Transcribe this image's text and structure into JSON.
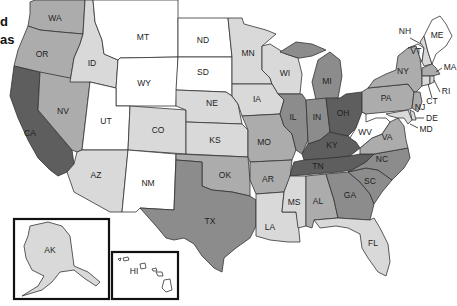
{
  "cutoff_text": {
    "line1": "d",
    "line2": "as"
  },
  "shades": {
    "white": "#ffffff",
    "light": "#d9d9d9",
    "medium_light": "#acacac",
    "medium": "#8c8c8c",
    "dark": "#5e5e5e"
  },
  "states": {
    "WA": {
      "label": "WA",
      "shade": "medium_light"
    },
    "OR": {
      "label": "OR",
      "shade": "medium_light"
    },
    "CA": {
      "label": "CA",
      "shade": "dark"
    },
    "NV": {
      "label": "NV",
      "shade": "medium_light"
    },
    "ID": {
      "label": "ID",
      "shade": "light"
    },
    "MT": {
      "label": "MT",
      "shade": "white"
    },
    "WY": {
      "label": "WY",
      "shade": "white"
    },
    "UT": {
      "label": "UT",
      "shade": "white"
    },
    "AZ": {
      "label": "AZ",
      "shade": "light"
    },
    "CO": {
      "label": "CO",
      "shade": "light"
    },
    "NM": {
      "label": "NM",
      "shade": "white"
    },
    "ND": {
      "label": "ND",
      "shade": "white"
    },
    "SD": {
      "label": "SD",
      "shade": "white"
    },
    "NE": {
      "label": "NE",
      "shade": "light"
    },
    "KS": {
      "label": "KS",
      "shade": "light"
    },
    "OK": {
      "label": "OK",
      "shade": "medium_light"
    },
    "TX": {
      "label": "TX",
      "shade": "medium"
    },
    "MN": {
      "label": "MN",
      "shade": "light"
    },
    "IA": {
      "label": "IA",
      "shade": "light"
    },
    "MO": {
      "label": "MO",
      "shade": "medium_light"
    },
    "AR": {
      "label": "AR",
      "shade": "medium_light"
    },
    "LA": {
      "label": "LA",
      "shade": "light"
    },
    "WI": {
      "label": "WI",
      "shade": "light"
    },
    "IL": {
      "label": "IL",
      "shade": "medium"
    },
    "MI": {
      "label": "MI",
      "shade": "medium"
    },
    "IN": {
      "label": "IN",
      "shade": "medium"
    },
    "OH": {
      "label": "OH",
      "shade": "dark"
    },
    "KY": {
      "label": "KY",
      "shade": "dark"
    },
    "TN": {
      "label": "TN",
      "shade": "dark"
    },
    "MS": {
      "label": "MS",
      "shade": "light"
    },
    "AL": {
      "label": "AL",
      "shade": "medium_light"
    },
    "GA": {
      "label": "GA",
      "shade": "medium"
    },
    "FL": {
      "label": "FL",
      "shade": "light"
    },
    "SC": {
      "label": "SC",
      "shade": "medium"
    },
    "NC": {
      "label": "NC",
      "shade": "medium"
    },
    "VA": {
      "label": "VA",
      "shade": "medium_light"
    },
    "WV": {
      "label": "WV",
      "shade": "white"
    },
    "PA": {
      "label": "PA",
      "shade": "medium_light"
    },
    "NY": {
      "label": "NY",
      "shade": "medium_light"
    },
    "VT": {
      "label": "VT",
      "shade": "white"
    },
    "NH": {
      "label": "NH",
      "shade": "light"
    },
    "ME": {
      "label": "ME",
      "shade": "white"
    },
    "MA": {
      "label": "MA",
      "shade": "medium_light"
    },
    "RI": {
      "label": "RI",
      "shade": "light"
    },
    "CT": {
      "label": "CT",
      "shade": "light"
    },
    "NJ": {
      "label": "NJ",
      "shade": "medium_light"
    },
    "DE": {
      "label": "DE",
      "shade": "light"
    },
    "MD": {
      "label": "MD",
      "shade": "light"
    },
    "AK": {
      "label": "AK",
      "shade": "light"
    },
    "HI": {
      "label": "HI",
      "shade": "white"
    }
  }
}
